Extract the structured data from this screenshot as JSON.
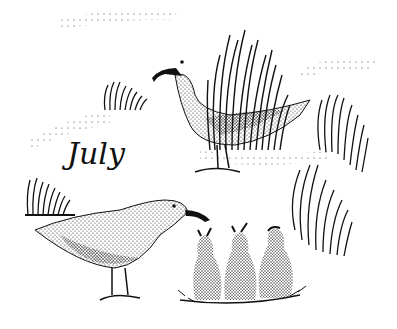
{
  "illustration": {
    "caption": "July",
    "style": "stipple pen-and-ink",
    "ink_color": "#111111",
    "paper_color": "#ffffff",
    "subjects": [
      {
        "name": "adult-gull-standing",
        "position": "upper-center"
      },
      {
        "name": "adult-gull-feeding",
        "position": "lower-left"
      },
      {
        "name": "gull-chick",
        "position": "lower-center-left"
      },
      {
        "name": "gull-chick",
        "position": "lower-center"
      },
      {
        "name": "gull-chick",
        "position": "lower-center-right"
      },
      {
        "name": "grass-tuft",
        "position": "upper-center"
      },
      {
        "name": "grass-tuft",
        "position": "right"
      },
      {
        "name": "grass-tuft",
        "position": "lower-right"
      },
      {
        "name": "grass-tuft",
        "position": "left"
      },
      {
        "name": "grass-tuft",
        "position": "lower-left"
      }
    ]
  }
}
